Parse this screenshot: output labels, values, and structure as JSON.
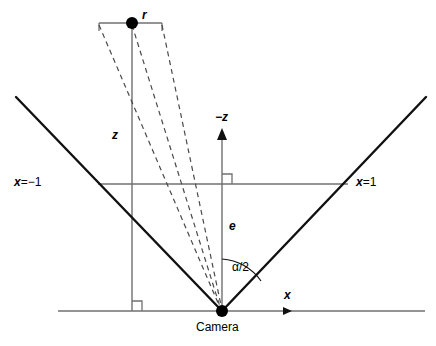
{
  "figure": {
    "background_color": "#ffffff",
    "line_color": "#000000",
    "thin_line_color": "#666666",
    "width": 436,
    "height": 346
  },
  "labels": {
    "point_r": "r",
    "depth_z": "z",
    "axis_negz": "−z",
    "focal_e": "e",
    "half_angle": "α/2",
    "axis_x": "x",
    "plane_left": "x",
    "plane_left_value": "=−1",
    "plane_right": "x",
    "plane_right_value": "=1",
    "camera": "Camera"
  },
  "geometry": {
    "camera_point": {
      "x": 222,
      "y": 311
    },
    "r_point": {
      "x": 132,
      "y": 23
    },
    "r_tick_left_x": 99,
    "r_tick_right_x": 162,
    "r_tick_y": 23,
    "ground_line": {
      "x1": 58,
      "y1": 311,
      "x2": 425,
      "y2": 311
    },
    "image_plane_line": {
      "x1": 98,
      "y1": 184,
      "x2": 348,
      "y2": 184
    },
    "frustum_left_top": {
      "x": 16,
      "y": 97
    },
    "frustum_right_top": {
      "x": 426,
      "y": 97
    },
    "axis_negz_tip": {
      "x": 222,
      "y": 132
    },
    "x_axis_arrow_tip": {
      "x": 292,
      "y": 311
    },
    "vertical_drop_x": 132,
    "arc_radius": 52
  }
}
